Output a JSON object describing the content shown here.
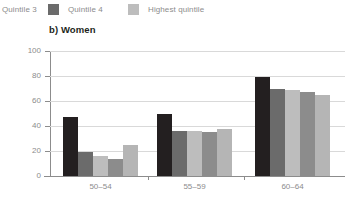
{
  "legend": {
    "items": [
      {
        "label": "Quintile 3",
        "color": "#a8a8a8",
        "swatch_visible": false
      },
      {
        "label": "Quintile 4",
        "color": "#6b6b6b",
        "swatch_visible": true
      },
      {
        "label": "Highest quintile",
        "color": "#bdbdbd",
        "swatch_visible": true
      }
    ]
  },
  "chart_data": {
    "type": "bar",
    "title": "b) Women",
    "xlabel": "",
    "ylabel": "",
    "ylim": [
      0,
      100
    ],
    "yticks": [
      0,
      20,
      40,
      60,
      80,
      100
    ],
    "grid": true,
    "legend_position": "top",
    "categories": [
      "50–54",
      "55–59",
      "60–64"
    ],
    "series": [
      {
        "name": "Lowest quintile",
        "color": "#231f20",
        "values": [
          47,
          50,
          79
        ]
      },
      {
        "name": "Quintile 2",
        "color": "#6b6b6b",
        "values": [
          19,
          36,
          70
        ]
      },
      {
        "name": "Quintile 3",
        "color": "#bdbdbd",
        "values": [
          16,
          36,
          69
        ]
      },
      {
        "name": "Quintile 4",
        "color": "#8c8c8c",
        "values": [
          14,
          35,
          67
        ]
      },
      {
        "name": "Highest quintile",
        "color": "#b5b5b5",
        "values": [
          25,
          38,
          65
        ]
      }
    ]
  }
}
